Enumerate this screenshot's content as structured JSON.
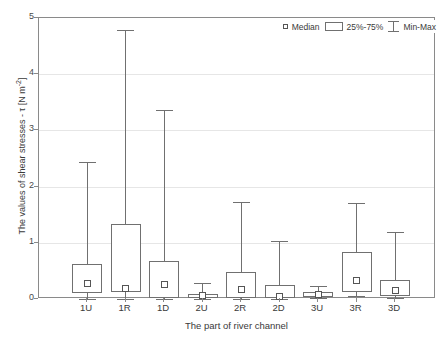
{
  "chart_data": {
    "type": "box",
    "title": "",
    "xlabel": "The part of river channel",
    "ylabel": "The values of shear stresses - τ [N m-2]",
    "ylabel_prefix": "The values of shear stresses - τ [N m",
    "ylabel_exponent": "-2",
    "ylabel_suffix": "]",
    "ylim": [
      0,
      5
    ],
    "yticks": [
      0,
      1,
      2,
      3,
      4,
      5
    ],
    "ytick_labels": [
      "0",
      "1",
      "2",
      "3",
      "4",
      "5"
    ],
    "grid": true,
    "legend_position": "top-right",
    "categories": [
      "1U",
      "1R",
      "1D",
      "2U",
      "2R",
      "2D",
      "3U",
      "3R",
      "3D"
    ],
    "legend": [
      {
        "key": "median",
        "label": "Median",
        "glyph": "square-marker"
      },
      {
        "key": "iqr",
        "label": "25%-75%",
        "glyph": "box-outline"
      },
      {
        "key": "minmax",
        "label": "Min-Max",
        "glyph": "whisker-bar"
      }
    ],
    "boxes": [
      {
        "category": "1U",
        "min": 0.0,
        "q1": 0.11,
        "median": 0.28,
        "q3": 0.62,
        "max": 2.44
      },
      {
        "category": "1R",
        "min": 0.0,
        "q1": 0.12,
        "median": 0.19,
        "q3": 1.34,
        "max": 4.79
      },
      {
        "category": "1D",
        "min": 0.0,
        "q1": 0.02,
        "median": 0.26,
        "q3": 0.68,
        "max": 3.36
      },
      {
        "category": "2U",
        "min": 0.0,
        "q1": 0.02,
        "median": 0.06,
        "q3": 0.09,
        "max": 0.29
      },
      {
        "category": "2R",
        "min": 0.0,
        "q1": 0.02,
        "median": 0.17,
        "q3": 0.48,
        "max": 1.73
      },
      {
        "category": "2D",
        "min": 0.0,
        "q1": 0.01,
        "median": 0.05,
        "q3": 0.25,
        "max": 1.03
      },
      {
        "category": "3U",
        "min": 0.01,
        "q1": 0.04,
        "median": 0.08,
        "q3": 0.13,
        "max": 0.23
      },
      {
        "category": "3R",
        "min": 0.05,
        "q1": 0.13,
        "median": 0.33,
        "q3": 0.83,
        "max": 1.7
      },
      {
        "category": "3D",
        "min": 0.02,
        "q1": 0.06,
        "median": 0.15,
        "q3": 0.33,
        "max": 1.2
      }
    ]
  },
  "colors": {
    "frame": "#8a8a8a",
    "grid": "#e6e6e6",
    "box_stroke": "#707070",
    "median_stroke": "#555555",
    "text": "#3a3a3a",
    "background": "#ffffff"
  }
}
